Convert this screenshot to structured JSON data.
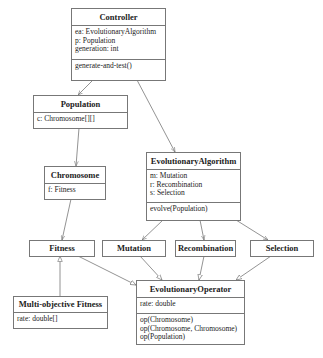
{
  "classes": {
    "controller": {
      "name": "Controller",
      "attributes": [
        "ea: EvolutionaryAlgorithm",
        "p: Population",
        "generation: int"
      ],
      "operations": [
        "generate-and-test()"
      ]
    },
    "population": {
      "name": "Population",
      "attributes": [
        "c: Chromosome[][]"
      ]
    },
    "chromosome": {
      "name": "Chromosome",
      "attributes": [
        "f: Fitness"
      ]
    },
    "evolutionary_algorithm": {
      "name": "EvolutionaryAlgorithm",
      "attributes": [
        "m: Mutation",
        "r: Recombination",
        "s: Selection"
      ],
      "operations": [
        "evolve(Population)"
      ]
    },
    "fitness": {
      "name": "Fitness"
    },
    "mutation": {
      "name": "Mutation"
    },
    "recombination": {
      "name": "Recombination"
    },
    "selection": {
      "name": "Selection"
    },
    "multi_objective_fitness": {
      "name": "Multi-objective Fitness",
      "attributes": [
        "rate: double[]"
      ]
    },
    "evolutionary_operator": {
      "name": "EvolutionaryOperator",
      "attributes": [
        "rate: double"
      ],
      "operations": [
        "op(Chromosome)",
        "op(Chromosome, Chromosome)",
        "op(Population)"
      ]
    }
  },
  "relationships": [
    {
      "from": "Controller",
      "to": "Population",
      "type": "association"
    },
    {
      "from": "Controller",
      "to": "EvolutionaryAlgorithm",
      "type": "association"
    },
    {
      "from": "Population",
      "to": "Chromosome",
      "type": "association"
    },
    {
      "from": "Chromosome",
      "to": "Fitness",
      "type": "association"
    },
    {
      "from": "EvolutionaryAlgorithm",
      "to": "Mutation",
      "type": "association"
    },
    {
      "from": "EvolutionaryAlgorithm",
      "to": "Recombination",
      "type": "association"
    },
    {
      "from": "EvolutionaryAlgorithm",
      "to": "Selection",
      "type": "association"
    },
    {
      "from": "Multi-objective Fitness",
      "to": "Fitness",
      "type": "generalization"
    },
    {
      "from": "Fitness",
      "to": "EvolutionaryOperator",
      "type": "generalization"
    },
    {
      "from": "Mutation",
      "to": "EvolutionaryOperator",
      "type": "generalization"
    },
    {
      "from": "Recombination",
      "to": "EvolutionaryOperator",
      "type": "generalization"
    },
    {
      "from": "Selection",
      "to": "EvolutionaryOperator",
      "type": "generalization"
    }
  ]
}
